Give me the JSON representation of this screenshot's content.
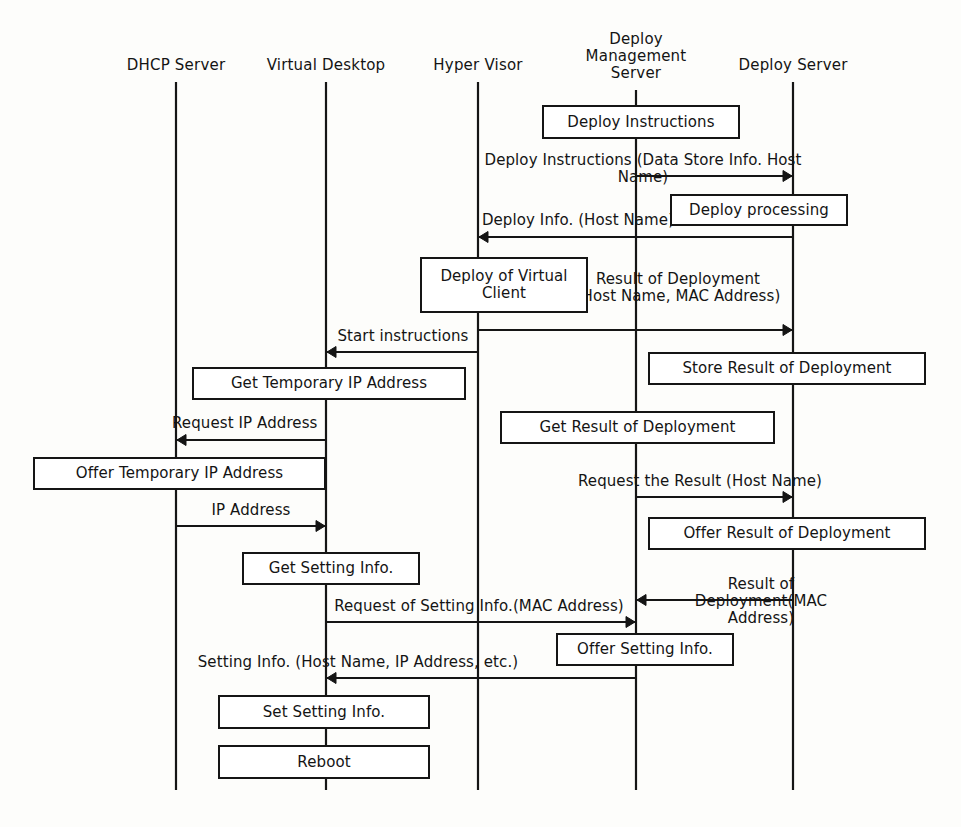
{
  "diagram": {
    "type": "sequence-diagram",
    "stroke_color": "#151515",
    "background_color": "#fdfdfb",
    "lifelines": [
      {
        "id": "dhcp",
        "label": "DHCP Server",
        "x": 176
      },
      {
        "id": "vdesktop",
        "label": "Virtual Desktop",
        "x": 326
      },
      {
        "id": "hypervisor",
        "label": "Hyper Visor",
        "x": 478
      },
      {
        "id": "deploymgmt",
        "label": "Deploy\nManagement\nServer",
        "x": 636
      },
      {
        "id": "deploysrv",
        "label": "Deploy Server",
        "x": 793
      }
    ],
    "activity_boxes": [
      {
        "id": "deploy-instructions",
        "label": "Deploy Instructions",
        "x": 542,
        "y": 105,
        "w": 198,
        "h": 34
      },
      {
        "id": "deploy-processing",
        "label": "Deploy processing",
        "x": 670,
        "y": 194,
        "w": 178,
        "h": 32
      },
      {
        "id": "deploy-of-virtual-client",
        "label": "Deploy of Virtual\nClient",
        "x": 420,
        "y": 257,
        "w": 168,
        "h": 56
      },
      {
        "id": "store-result",
        "label": "Store Result of Deployment",
        "x": 648,
        "y": 352,
        "w": 278,
        "h": 33
      },
      {
        "id": "get-temporary-ip",
        "label": "Get Temporary IP Address",
        "x": 192,
        "y": 367,
        "w": 274,
        "h": 33
      },
      {
        "id": "get-result",
        "label": "Get Result of Deployment",
        "x": 500,
        "y": 411,
        "w": 275,
        "h": 33
      },
      {
        "id": "offer-temporary-ip",
        "label": "Offer Temporary IP Address",
        "x": 33,
        "y": 457,
        "w": 293,
        "h": 33
      },
      {
        "id": "offer-result",
        "label": "Offer Result of Deployment",
        "x": 648,
        "y": 517,
        "w": 278,
        "h": 33
      },
      {
        "id": "get-setting-info",
        "label": "Get Setting Info.",
        "x": 242,
        "y": 552,
        "w": 178,
        "h": 33
      },
      {
        "id": "offer-setting-info",
        "label": "Offer Setting Info.",
        "x": 556,
        "y": 633,
        "w": 178,
        "h": 33
      },
      {
        "id": "set-setting-info",
        "label": "Set Setting Info.",
        "x": 218,
        "y": 695,
        "w": 212,
        "h": 34
      },
      {
        "id": "reboot",
        "label": "Reboot",
        "x": 218,
        "y": 745,
        "w": 212,
        "h": 34
      }
    ],
    "messages": [
      {
        "id": "deploy-instructions-msg",
        "label": "Deploy Instructions (Data Store Info. Host Name)",
        "from": "deploymgmt",
        "to": "deploysrv",
        "x1": 636,
        "x2": 793,
        "y": 176,
        "direction": "right",
        "label_x": 643,
        "label_y": 152,
        "label_align": "center"
      },
      {
        "id": "deploy-info-msg",
        "label": "Deploy Info. (Host Name)",
        "from": "deploysrv",
        "to": "hypervisor",
        "x1": 793,
        "x2": 478,
        "y": 237,
        "direction": "left",
        "label_x": 578,
        "label_y": 212,
        "label_align": "center"
      },
      {
        "id": "result-of-deployment-msg",
        "label": "Result of Deployment\n(Host Name, MAC Address)",
        "from": "hypervisor",
        "to": "deploysrv",
        "x1": 478,
        "x2": 793,
        "y": 330,
        "direction": "right",
        "label_x": 678,
        "label_y": 288,
        "label_align": "center"
      },
      {
        "id": "start-instructions-msg",
        "label": "Start instructions",
        "from": "hypervisor",
        "to": "vdesktop",
        "x1": 478,
        "x2": 326,
        "y": 352,
        "direction": "left",
        "label_x": 403,
        "label_y": 328,
        "label_align": "center"
      },
      {
        "id": "request-ip-address-msg",
        "label": "Request IP Address",
        "from": "vdesktop",
        "to": "dhcp",
        "x1": 326,
        "x2": 176,
        "y": 440,
        "direction": "left",
        "label_x": 172,
        "label_y": 415,
        "label_align": "left"
      },
      {
        "id": "request-the-result-msg",
        "label": "Request the Result (Host Name)",
        "from": "deploymgmt",
        "to": "deploysrv",
        "x1": 636,
        "x2": 793,
        "y": 497,
        "direction": "right",
        "label_x": 700,
        "label_y": 473,
        "label_align": "center"
      },
      {
        "id": "ip-address-msg",
        "label": "IP Address",
        "from": "dhcp",
        "to": "vdesktop",
        "x1": 176,
        "x2": 326,
        "y": 526,
        "direction": "right",
        "label_x": 251,
        "label_y": 502,
        "label_align": "center"
      },
      {
        "id": "result-of-deployment-mac-msg",
        "label": "Result of Deployment(MAC Address)",
        "from": "deploysrv",
        "to": "deploymgmt",
        "x1": 793,
        "x2": 636,
        "y": 600,
        "direction": "left",
        "label_x": 761,
        "label_y": 576,
        "label_align": "center"
      },
      {
        "id": "request-setting-info-msg",
        "label": "Request of Setting Info.(MAC Address)",
        "from": "vdesktop",
        "to": "deploymgmt",
        "x1": 326,
        "x2": 636,
        "y": 622,
        "direction": "right",
        "label_x": 479,
        "label_y": 598,
        "label_align": "center"
      },
      {
        "id": "setting-info-msg",
        "label": "Setting Info. (Host Name, IP Address, etc.)",
        "from": "deploymgmt",
        "to": "vdesktop",
        "x1": 636,
        "x2": 326,
        "y": 678,
        "direction": "left",
        "label_x": 358,
        "label_y": 654,
        "label_align": "center"
      }
    ],
    "lifeline_geometry": {
      "top_y": 82,
      "bottom_y": 790,
      "deploymgmt_top_y": 90,
      "deployserver_top_y": 82
    }
  }
}
